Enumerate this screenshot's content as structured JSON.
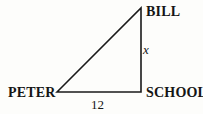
{
  "figure": {
    "type": "right-triangle-diagram",
    "vertices": {
      "top": "BILL",
      "bottom_left": "PETER",
      "bottom_right": "SCHOOL"
    },
    "sides": {
      "vertical_leg_label": "x",
      "base_label": "12"
    },
    "colors": {
      "line": "#1a1a1a",
      "background": "#fdfdfb",
      "text": "#151515"
    }
  }
}
